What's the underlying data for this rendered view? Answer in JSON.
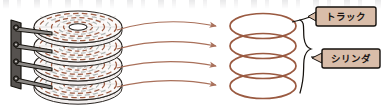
{
  "figure": {
    "kind": "hard-disk-drive-geometry-diagram",
    "language": "ja",
    "background_color": "#ffffff",
    "colors": {
      "track_brown": "#9b5b42",
      "ring_brown": "#9a5a41",
      "arrow_brown": "#a9705a",
      "platter_fill": "#fbf9f8",
      "platter_edge": "#2b2622",
      "actuator_gray": "#585552",
      "actuator_dark": "#17140f",
      "label_box_fill": "#d9bda9",
      "label_box_border": "#15110d",
      "label_text": "#1a1512",
      "brace_color": "#15110d",
      "sector_gray": "#b9b4b2"
    },
    "platter_stack": {
      "platter_count": 4,
      "has_center_spindle_hole": true,
      "tracks_per_platter": 6,
      "track_style": "dashed-concentric"
    },
    "actuator": {
      "arm_count": 4,
      "pivot_count": 4,
      "orientation": "vertical-bar-left"
    },
    "arrows": {
      "count": 4,
      "direction": "left-to-right",
      "style": "curved-with-arrowhead"
    },
    "cylinder_rings": {
      "count": 4,
      "shape": "ellipse-outline"
    },
    "brace": {
      "shape": "curly-brace",
      "orientation": "right",
      "spans": "all-four-rings"
    },
    "labels": [
      {
        "id": "track",
        "text": "トラック",
        "points_to": "topmost-ring",
        "box_x": 316,
        "box_y": 7,
        "box_w": 60,
        "box_h": 19
      },
      {
        "id": "cylinder",
        "text": "シリンダ",
        "points_to": "brace",
        "box_x": 322,
        "box_y": 49,
        "box_w": 58,
        "box_h": 19
      }
    ]
  }
}
